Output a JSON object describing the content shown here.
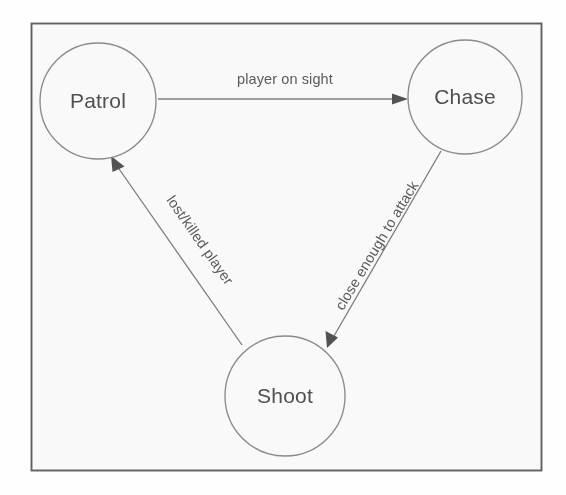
{
  "diagram": {
    "type": "finite-state-machine",
    "frame": {
      "x": 31,
      "y": 23,
      "width": 510,
      "height": 447,
      "stroke_color": "#5d5d5d",
      "background_color": "#ffffff"
    },
    "style": {
      "node_stroke_color": "#8a8a8a",
      "node_fill_color": "#ffffff",
      "edge_color": "#7b7b7b",
      "arrowhead_color": "#4e4e4e",
      "text_color": "#4a4a4a"
    },
    "states": [
      {
        "id": "patrol",
        "label": "Patrol",
        "cx": 98,
        "cy": 101,
        "r": 58
      },
      {
        "id": "chase",
        "label": "Chase",
        "cx": 465,
        "cy": 97,
        "r": 57
      },
      {
        "id": "shoot",
        "label": "Shoot",
        "cx": 285,
        "cy": 396,
        "r": 60
      }
    ],
    "transitions": [
      {
        "id": "patrol-to-chase",
        "from": "patrol",
        "to": "chase",
        "label": "player on sight",
        "label_x": 285,
        "label_y": 84,
        "label_rotation": 0,
        "x1": 158,
        "y1": 99,
        "x2": 406,
        "y2": 99
      },
      {
        "id": "chase-to-shoot",
        "from": "chase",
        "to": "shoot",
        "label": "close enough to attack",
        "label_x": 381,
        "label_y": 248,
        "label_rotation": -59,
        "x1": 441,
        "y1": 151,
        "x2": 329,
        "y2": 345
      },
      {
        "id": "shoot-to-patrol",
        "from": "shoot",
        "to": "patrol",
        "label": "lost/killed player",
        "label_x": 196,
        "label_y": 243,
        "label_rotation": 59,
        "x1": 242,
        "y1": 345,
        "x2": 112,
        "y2": 157
      }
    ]
  }
}
